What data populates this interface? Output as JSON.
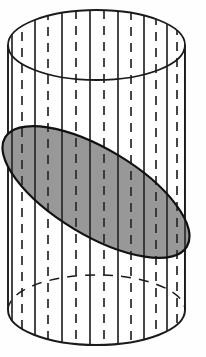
{
  "figure": {
    "title": "Cylinder cut by an oblique plane forming an elliptical cross-section",
    "caption": "",
    "background_color": "#fefefe",
    "stroke_color": "#1a1a1a",
    "shaded_fill_color": "#989898",
    "shaded_stroke_color": "#111111",
    "width": 206,
    "height": 357
  },
  "chart_data": {
    "type": "diagram",
    "xlabel": "",
    "ylabel": "",
    "cylinder": {
      "center_x": 96.5,
      "radius_x": 88.5,
      "top_center_y": 45,
      "bottom_center_y": 310,
      "ellipse_radius_y": 35,
      "body_height": 265
    },
    "cross_section_ellipse": {
      "center_x": 96,
      "center_y": 192,
      "semi_major": 106,
      "semi_minor": 43,
      "rotation_deg": 31,
      "fill": "#989898",
      "stroke": "#111111",
      "stroke_width": 2.2
    },
    "ruling_lines": {
      "count": 15,
      "pattern": [
        "solid",
        "dashed"
      ],
      "note": "Vertical ruling lines alternate between solid and dashed, spanning from the top ellipse rim down to the bottom ellipse rim.",
      "x_positions": [
        12,
        22,
        35,
        48,
        62,
        76,
        90,
        104,
        118,
        131,
        144,
        156,
        167,
        177,
        185
      ],
      "styles": [
        "solid",
        "dashed",
        "solid",
        "dashed",
        "solid",
        "dashed",
        "solid",
        "dashed",
        "solid",
        "dashed",
        "solid",
        "dashed",
        "solid",
        "dashed",
        "solid"
      ]
    },
    "outline_styles": {
      "top_ellipse_front": "solid",
      "top_ellipse_back": "solid",
      "bottom_ellipse_front": "solid",
      "bottom_ellipse_back": "dashed",
      "left_side": "solid",
      "right_side": "solid"
    },
    "grid": false,
    "legend": []
  }
}
